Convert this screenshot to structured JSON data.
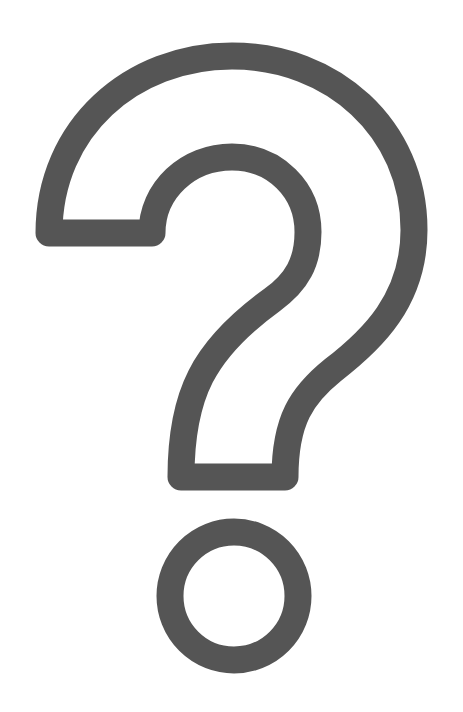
{
  "graphic": {
    "label": "Question mark",
    "icon": "question-mark-outline-icon",
    "stroke_color": "#555555",
    "background_color": "#ffffff",
    "stroke_width": 27
  }
}
